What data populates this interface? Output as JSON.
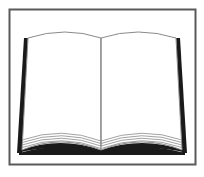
{
  "image": {
    "subject": "open-book-icon",
    "colors": {
      "background": "#ffffff",
      "frame": "#5a5a5a",
      "cover": "#1a1a1a",
      "page_line": "#8a8a8a"
    }
  }
}
